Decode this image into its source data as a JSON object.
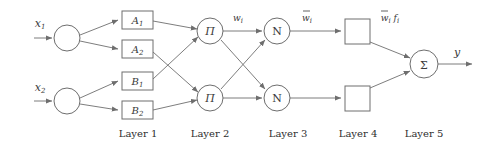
{
  "figure": {
    "type": "anfis-network-diagram",
    "background": "#ffffff",
    "stroke_color": "#6e6e6e",
    "text_color": "#3a3a3a"
  },
  "inputs": [
    {
      "id": "x1",
      "label": "x",
      "sub": "1",
      "cx": 67,
      "cy": 38,
      "r": 13
    },
    {
      "id": "x2",
      "label": "x",
      "sub": "2",
      "cx": 67,
      "cy": 101,
      "r": 13
    }
  ],
  "layer1": {
    "name": "Layer 1",
    "label_x": 138,
    "label_y": 137,
    "boxes": [
      {
        "id": "A1",
        "label": "A",
        "sub": "1",
        "x": 122,
        "y": 11,
        "w": 31,
        "h": 18
      },
      {
        "id": "A2",
        "label": "A",
        "sub": "2",
        "x": 122,
        "y": 40,
        "w": 31,
        "h": 18
      },
      {
        "id": "B1",
        "label": "B",
        "sub": "1",
        "x": 122,
        "y": 72,
        "w": 31,
        "h": 18
      },
      {
        "id": "B2",
        "label": "B",
        "sub": "2",
        "x": 122,
        "y": 101,
        "w": 31,
        "h": 18
      }
    ]
  },
  "layer2": {
    "name": "Layer 2",
    "label_x": 210,
    "label_y": 137,
    "nodes": [
      {
        "id": "pi-top",
        "label": "Π",
        "cx": 210,
        "cy": 31,
        "r": 13
      },
      {
        "id": "pi-bottom",
        "label": "Π",
        "cx": 210,
        "cy": 98,
        "r": 13
      }
    ]
  },
  "layer3": {
    "name": "Layer 3",
    "label_x": 288,
    "label_y": 137,
    "nodes": [
      {
        "id": "n-top",
        "label": "N",
        "cx": 277,
        "cy": 31,
        "r": 13
      },
      {
        "id": "n-bottom",
        "label": "N",
        "cx": 277,
        "cy": 98,
        "r": 13
      }
    ]
  },
  "layer4": {
    "name": "Layer 4",
    "label_x": 358,
    "label_y": 137,
    "boxes": [
      {
        "id": "sq-top",
        "x": 345,
        "y": 19,
        "w": 25,
        "h": 25
      },
      {
        "id": "sq-bottom",
        "x": 345,
        "y": 86,
        "w": 25,
        "h": 25
      }
    ]
  },
  "layer5": {
    "name": "Layer 5",
    "label_x": 424,
    "label_y": 137,
    "node": {
      "id": "sigma",
      "label": "Σ",
      "cx": 424,
      "cy": 64,
      "r": 14
    }
  },
  "edge_labels": [
    {
      "id": "w-i",
      "text": "w",
      "sub": "i",
      "overbar": false,
      "x": 238,
      "y": 19
    },
    {
      "id": "w-bar-i",
      "text": "w",
      "sub": "i",
      "overbar": true,
      "x": 307,
      "y": 19
    },
    {
      "id": "w-bar-i-f-i",
      "text": "w",
      "sub": "i",
      "overbar": true,
      "tail": "f",
      "tail_sub": "i",
      "x": 385,
      "y": 19
    }
  ],
  "output": {
    "id": "y",
    "label": "y",
    "x": 458,
    "y": 56
  }
}
